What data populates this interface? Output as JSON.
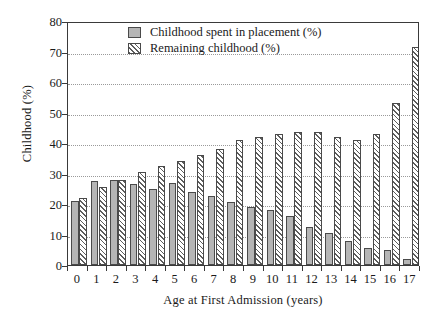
{
  "chart_data": {
    "type": "bar",
    "title": "",
    "xlabel": "Age at First Admission (years)",
    "ylabel": "Childhood (%)",
    "categories": [
      "0",
      "1",
      "2",
      "3",
      "4",
      "5",
      "6",
      "7",
      "8",
      "9",
      "10",
      "11",
      "12",
      "13",
      "14",
      "15",
      "16",
      "17"
    ],
    "ylim": [
      0,
      80
    ],
    "ytick_values": [
      0,
      10,
      20,
      30,
      40,
      50,
      60,
      70,
      80
    ],
    "ytick_labels": [
      "0",
      "10",
      "20",
      "30",
      "40",
      "50",
      "60",
      "70",
      "80"
    ],
    "grid": true,
    "legend_position": "top-center",
    "series": [
      {
        "name": "Childhood spent in placement (%)",
        "style": "solid-grey",
        "values": [
          21,
          27.5,
          28,
          26.5,
          25,
          27,
          24,
          22.5,
          20.5,
          19,
          18,
          16,
          12.5,
          10.5,
          8,
          5.5,
          5,
          2
        ]
      },
      {
        "name": "Remaining childhood (%)",
        "style": "diagonal-hatch",
        "values": [
          22,
          25.5,
          28,
          30.5,
          32.5,
          34,
          36,
          38,
          41,
          42,
          43,
          43.5,
          43.5,
          42,
          41,
          43,
          53,
          71.5
        ]
      }
    ],
    "colors": {
      "solid_fill": "#b5b5b5",
      "hatch_line": "#5d5d5d",
      "bar_edge": "#4a4a4a",
      "axis": "#3a3a3a",
      "gridline": "#9a9a9a",
      "background": "#ffffff"
    }
  },
  "legend": {
    "items": [
      {
        "label": "Childhood spent in placement (%)",
        "style": "solid"
      },
      {
        "label": "Remaining childhood (%)",
        "style": "hatch"
      }
    ]
  }
}
